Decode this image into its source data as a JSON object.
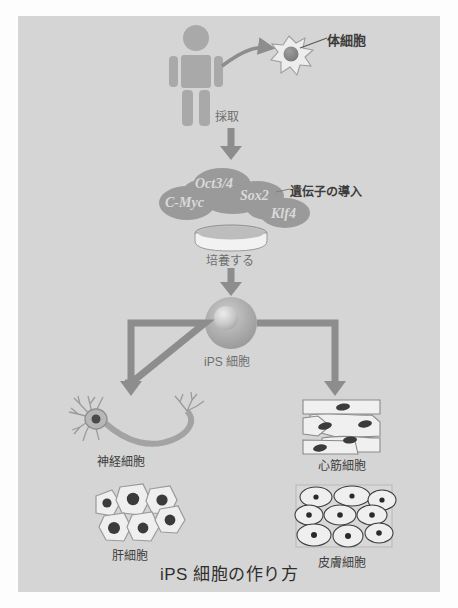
{
  "figure": {
    "title": "iPS 細胞の作り方",
    "background_color": "#d5d5d5",
    "page_color": "#fdfdfd",
    "label_color": "#6e6e6e",
    "arrow_color": "#8d8d8d",
    "gene_blob_color": "#9a9a9a",
    "gene_text_color": "#d9d9d9"
  },
  "steps": {
    "person": {
      "name": "human-figure",
      "color": "#a8a8a8"
    },
    "somatic_cell": {
      "label": "体細胞",
      "cell_fill": "#e8e8e8",
      "nucleus_fill": "#8a8a8a"
    },
    "harvest": {
      "label": "採取"
    },
    "genes": {
      "callout": "遺伝子の導入",
      "items": [
        {
          "name": "Oct3/4",
          "label": "Oct3/4"
        },
        {
          "name": "C-Myc",
          "label": "C-Myc"
        },
        {
          "name": "Sox2",
          "label": "Sox2"
        },
        {
          "name": "Klf4",
          "label": "Klf4"
        }
      ]
    },
    "culture": {
      "label": "培養する",
      "dish_fill": "#f2f2f2"
    },
    "ips_cell": {
      "label": "iPS 細胞",
      "body_fill": "#b5b5b5",
      "nucleus_fill": "#d8d8d8"
    }
  },
  "derivatives": [
    {
      "name": "neuron",
      "label": "神経細胞"
    },
    {
      "name": "cardiac-muscle",
      "label": "心筋細胞"
    },
    {
      "name": "hepatocyte",
      "label": "肝細胞"
    },
    {
      "name": "skin-cell",
      "label": "皮膚細胞"
    }
  ]
}
